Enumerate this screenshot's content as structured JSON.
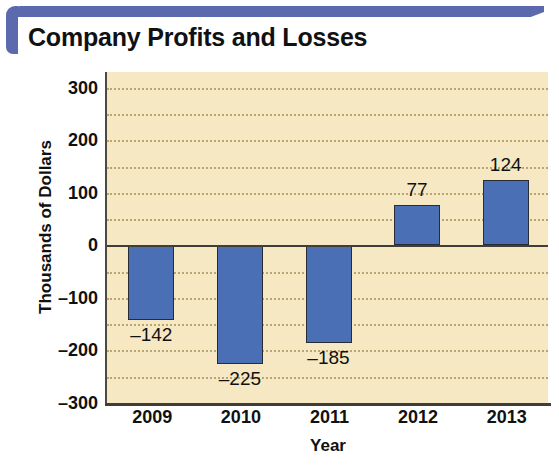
{
  "header": {
    "title": "Company Profits and Losses",
    "accent_color": "#5a6aad"
  },
  "chart_data": {
    "type": "bar",
    "title": "Company Profits and Losses",
    "categories": [
      "2009",
      "2010",
      "2011",
      "2012",
      "2013"
    ],
    "values": [
      -142,
      -225,
      -185,
      77,
      124
    ],
    "value_labels": [
      "–142",
      "–225",
      "–185",
      "77",
      "124"
    ],
    "xlabel": "Year",
    "ylabel": "Thousands of Dollars",
    "ylim": [
      -300,
      330
    ],
    "yticks": [
      300,
      200,
      100,
      0,
      -100,
      -200,
      -300
    ],
    "ytick_labels": [
      "300",
      "200",
      "100",
      "0",
      "–100",
      "–200",
      "–300"
    ],
    "gridlines": [
      300,
      250,
      200,
      150,
      100,
      50,
      -50,
      -100,
      -150,
      -200,
      -250,
      -300
    ],
    "grid": true,
    "legend": null,
    "bar_color": "#4a6fb5",
    "bar_border_color": "#272c35",
    "plot_background": "#f6e8c3",
    "gridline_color": "#b9a473",
    "axis_color": "#403e38"
  }
}
